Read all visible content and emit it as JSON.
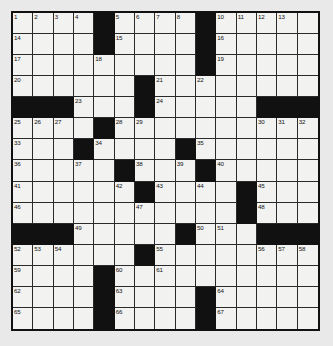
{
  "puzzle": {
    "type": "crossword-grid",
    "rows": 15,
    "columns": 15,
    "colors": {
      "page_background": "#e9e9e9",
      "grid_border": "#111111",
      "open_cell": "#f2f2f0",
      "blocked_cell": "#111111",
      "number_text": "#111111"
    },
    "blocked_cells": [
      [
        1,
        5
      ],
      [
        1,
        10
      ],
      [
        2,
        5
      ],
      [
        2,
        10
      ],
      [
        3,
        10
      ],
      [
        4,
        7
      ],
      [
        5,
        1
      ],
      [
        5,
        2
      ],
      [
        5,
        3
      ],
      [
        5,
        7
      ],
      [
        5,
        13
      ],
      [
        5,
        14
      ],
      [
        5,
        15
      ],
      [
        6,
        5
      ],
      [
        7,
        4
      ],
      [
        7,
        9
      ],
      [
        8,
        6
      ],
      [
        8,
        10
      ],
      [
        9,
        7
      ],
      [
        9,
        12
      ],
      [
        10,
        12
      ],
      [
        11,
        1
      ],
      [
        11,
        2
      ],
      [
        11,
        3
      ],
      [
        11,
        9
      ],
      [
        11,
        13
      ],
      [
        11,
        14
      ],
      [
        11,
        15
      ],
      [
        12,
        7
      ],
      [
        13,
        5
      ],
      [
        14,
        5
      ],
      [
        14,
        10
      ],
      [
        15,
        5
      ],
      [
        15,
        10
      ]
    ],
    "numbered_cells": [
      {
        "number": "1",
        "row": 1,
        "col": 1
      },
      {
        "number": "2",
        "row": 1,
        "col": 2
      },
      {
        "number": "3",
        "row": 1,
        "col": 3
      },
      {
        "number": "4",
        "row": 1,
        "col": 4
      },
      {
        "number": "5",
        "row": 1,
        "col": 6
      },
      {
        "number": "6",
        "row": 1,
        "col": 7
      },
      {
        "number": "7",
        "row": 1,
        "col": 8
      },
      {
        "number": "8",
        "row": 1,
        "col": 9
      },
      {
        "number": "9",
        "row": 1,
        "col": 10
      },
      {
        "number": "10",
        "row": 1,
        "col": 11
      },
      {
        "number": "11",
        "row": 1,
        "col": 12
      },
      {
        "number": "12",
        "row": 1,
        "col": 13
      },
      {
        "number": "13",
        "row": 1,
        "col": 14
      },
      {
        "number": "14",
        "row": 2,
        "col": 1
      },
      {
        "number": "15",
        "row": 2,
        "col": 6
      },
      {
        "number": "16",
        "row": 2,
        "col": 11
      },
      {
        "number": "17",
        "row": 3,
        "col": 1
      },
      {
        "number": "18",
        "row": 3,
        "col": 5
      },
      {
        "number": "19",
        "row": 3,
        "col": 11
      },
      {
        "number": "20",
        "row": 4,
        "col": 1
      },
      {
        "number": "21",
        "row": 4,
        "col": 8
      },
      {
        "number": "22",
        "row": 4,
        "col": 10
      },
      {
        "number": "23",
        "row": 5,
        "col": 4
      },
      {
        "number": "24",
        "row": 5,
        "col": 8
      },
      {
        "number": "25",
        "row": 6,
        "col": 1
      },
      {
        "number": "26",
        "row": 6,
        "col": 2
      },
      {
        "number": "27",
        "row": 6,
        "col": 3
      },
      {
        "number": "28",
        "row": 6,
        "col": 6
      },
      {
        "number": "29",
        "row": 6,
        "col": 7
      },
      {
        "number": "30",
        "row": 6,
        "col": 13
      },
      {
        "number": "31",
        "row": 6,
        "col": 14
      },
      {
        "number": "32",
        "row": 6,
        "col": 15
      },
      {
        "number": "33",
        "row": 7,
        "col": 1
      },
      {
        "number": "34",
        "row": 7,
        "col": 5
      },
      {
        "number": "35",
        "row": 7,
        "col": 10
      },
      {
        "number": "36",
        "row": 8,
        "col": 1
      },
      {
        "number": "37",
        "row": 8,
        "col": 4
      },
      {
        "number": "38",
        "row": 8,
        "col": 7
      },
      {
        "number": "39",
        "row": 8,
        "col": 9
      },
      {
        "number": "40",
        "row": 8,
        "col": 11
      },
      {
        "number": "41",
        "row": 9,
        "col": 1
      },
      {
        "number": "42",
        "row": 9,
        "col": 6
      },
      {
        "number": "43",
        "row": 9,
        "col": 8
      },
      {
        "number": "44",
        "row": 9,
        "col": 10
      },
      {
        "number": "45",
        "row": 9,
        "col": 13
      },
      {
        "number": "46",
        "row": 10,
        "col": 1
      },
      {
        "number": "47",
        "row": 10,
        "col": 7
      },
      {
        "number": "48",
        "row": 10,
        "col": 13
      },
      {
        "number": "49",
        "row": 11,
        "col": 4
      },
      {
        "number": "50",
        "row": 11,
        "col": 10
      },
      {
        "number": "51",
        "row": 11,
        "col": 11
      },
      {
        "number": "52",
        "row": 12,
        "col": 1
      },
      {
        "number": "53",
        "row": 12,
        "col": 2
      },
      {
        "number": "54",
        "row": 12,
        "col": 3
      },
      {
        "number": "55",
        "row": 12,
        "col": 8
      },
      {
        "number": "56",
        "row": 12,
        "col": 13
      },
      {
        "number": "57",
        "row": 12,
        "col": 14
      },
      {
        "number": "58",
        "row": 12,
        "col": 15
      },
      {
        "number": "59",
        "row": 13,
        "col": 1
      },
      {
        "number": "60",
        "row": 13,
        "col": 6
      },
      {
        "number": "61",
        "row": 13,
        "col": 8
      },
      {
        "number": "62",
        "row": 14,
        "col": 1
      },
      {
        "number": "63",
        "row": 14,
        "col": 6
      },
      {
        "number": "64",
        "row": 14,
        "col": 11
      },
      {
        "number": "65",
        "row": 15,
        "col": 1
      },
      {
        "number": "66",
        "row": 15,
        "col": 6
      },
      {
        "number": "67",
        "row": 15,
        "col": 11
      }
    ],
    "cell_values": []
  }
}
